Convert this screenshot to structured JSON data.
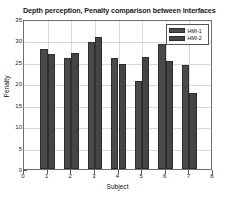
{
  "chart_data": {
    "type": "bar",
    "title": "Depth perception, Penalty comparison between interfaces",
    "xlabel": "Subject",
    "ylabel": "Penalty",
    "categories": [
      "1",
      "2",
      "3",
      "4",
      "5",
      "6",
      "7"
    ],
    "series": [
      {
        "name": "HMI-1",
        "values": [
          28.1,
          26.0,
          29.7,
          25.9,
          20.5,
          29.2,
          24.2
        ],
        "color": "#4a4a4a"
      },
      {
        "name": "HMI-2",
        "values": [
          26.9,
          27.1,
          30.7,
          24.6,
          26.1,
          25.3,
          17.7
        ],
        "color": "#454545"
      }
    ],
    "xlim": [
      0,
      8
    ],
    "ylim": [
      0,
      35
    ],
    "xticks": [
      "0",
      "1",
      "2",
      "3",
      "4",
      "5",
      "6",
      "7",
      "8"
    ],
    "yticks": [
      "0",
      "5",
      "10",
      "15",
      "20",
      "25",
      "30",
      "35"
    ],
    "grid": true,
    "legend_position": "top-right"
  }
}
